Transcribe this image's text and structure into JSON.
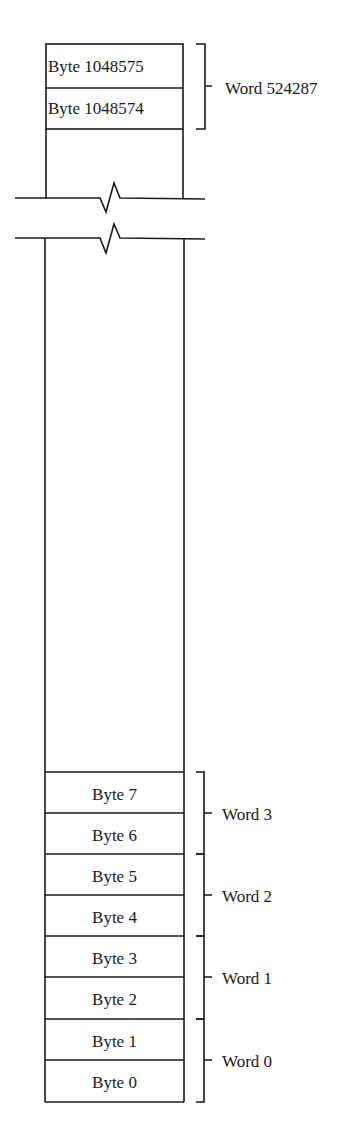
{
  "diagram": {
    "type": "memory-layout",
    "top_bytes": [
      {
        "label": "Byte 1048575"
      },
      {
        "label": "Byte 1048574"
      }
    ],
    "top_word": {
      "label": "Word 524287"
    },
    "bottom_bytes": [
      {
        "label": "Byte 7"
      },
      {
        "label": "Byte 6"
      },
      {
        "label": "Byte 5"
      },
      {
        "label": "Byte 4"
      },
      {
        "label": "Byte 3"
      },
      {
        "label": "Byte 2"
      },
      {
        "label": "Byte 1"
      },
      {
        "label": "Byte 0"
      }
    ],
    "bottom_words": [
      {
        "label": "Word 3"
      },
      {
        "label": "Word 2"
      },
      {
        "label": "Word 1"
      },
      {
        "label": "Word 0"
      }
    ],
    "colors": {
      "line": "#1a1a1a",
      "background": "#ffffff"
    }
  }
}
